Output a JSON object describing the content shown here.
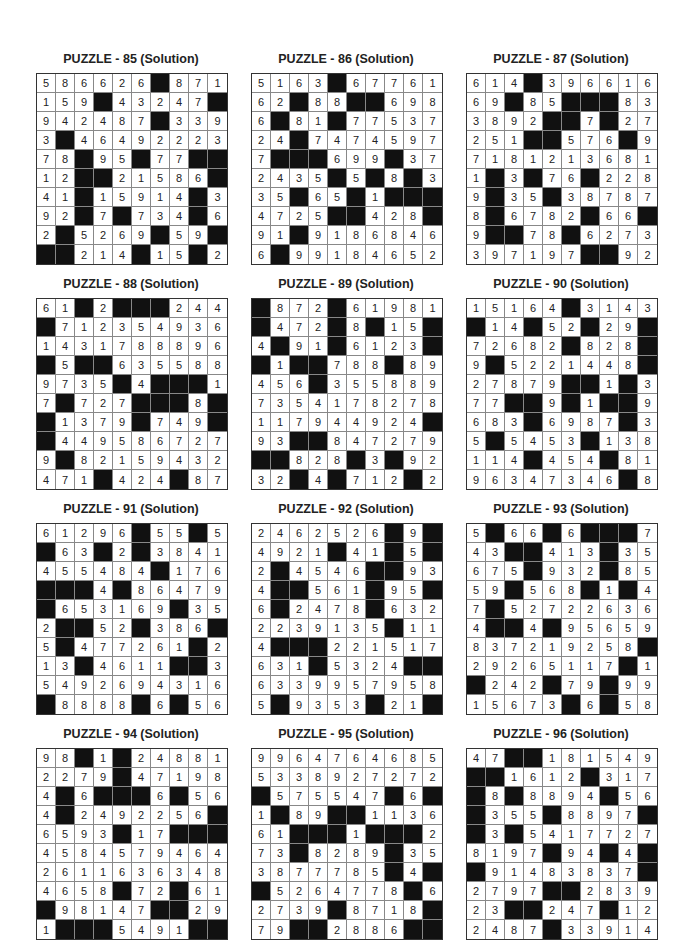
{
  "puzzles": [
    {
      "title": "PUZZLE - 85 (Solution)",
      "grid": [
        "5 8 6 6 2 6 # 8 7 1",
        "1 5 9 # 4 3 2 4 7 #",
        "9 4 2 4 8 7 # 3 3 9",
        "3 # 4 6 4 9 2 2 2 3",
        "7 8 # 9 5 # 7 7 # #",
        "1 2 # # 2 1 5 8 6 #",
        "4 1 # 1 5 9 1 4 # 3",
        "9 2 # 7 # 7 3 4 # 6",
        "2 # 5 2 6 9 # 5 9 #",
        "# # 2 1 4 # 1 5 # 2"
      ]
    },
    {
      "title": "PUZZLE - 86 (Solution)",
      "grid": [
        "5 1 6 3 # 6 7 7 6 1",
        "6 2 # 8 8 # # 6 9 8",
        "6 # 8 1 # 7 7 5 3 7",
        "2 4 # 7 4 7 4 5 9 7",
        "7 # # # 6 9 9 # 3 7",
        "2 4 3 5 # 5 # 8 # 3",
        "3 5 # 6 5 # 1 # # #",
        "4 7 2 5 # # 4 2 8 #",
        "9 1 # 9 1 8 6 8 4 6",
        "6 # 9 9 1 8 4 6 5 2"
      ]
    },
    {
      "title": "PUZZLE - 87 (Solution)",
      "grid": [
        "6 1 4 # 3 9 6 6 1 6",
        "6 9 # 8 5 # # # 8 3",
        "3 8 9 2 # # 7 # 2 7",
        "2 5 1 # # 5 7 6 # 9",
        "7 1 8 1 2 1 3 6 8 1",
        "1 # 3 # 7 6 # 2 2 8",
        "9 # 3 5 # 3 8 7 8 7",
        "8 # 6 7 8 2 # 6 6 #",
        "9 # # 7 8 # 6 2 7 3",
        "3 9 7 1 9 7 # # 9 2"
      ]
    },
    {
      "title": "PUZZLE - 88 (Solution)",
      "grid": [
        "6 1 # 2 # # # 2 4 4",
        "# 7 1 2 3 5 4 9 3 6",
        "1 4 3 1 7 8 8 8 9 6",
        "# 5 # # 6 3 5 5 8 8",
        "9 7 3 5 # 4 # # # 1",
        "7 # 7 2 7 # # # 8 #",
        "# 1 3 7 9 # 7 4 9 #",
        "# 4 4 9 5 8 6 7 2 7",
        "9 # 8 2 1 5 9 4 3 2",
        "4 7 1 # 4 2 4 # 8 7"
      ]
    },
    {
      "title": "PUZZLE - 89 (Solution)",
      "grid": [
        "# 8 7 2 # 6 1 9 8 1",
        "# 4 7 2 # 8 # 1 5 #",
        "4 # 9 1 # 6 1 2 3 #",
        "# 1 # # 7 8 8 # 8 9",
        "4 5 6 # 3 5 5 8 8 9",
        "7 3 5 4 1 7 8 2 7 8",
        "1 1 7 9 4 4 9 2 4 #",
        "9 3 # # 8 4 7 2 7 9",
        "# # 8 2 8 # 3 # 9 2",
        "3 2 # 4 # 7 1 2 # 2"
      ]
    },
    {
      "title": "PUZZLE - 90 (Solution)",
      "grid": [
        "1 5 1 6 4 # 3 1 4 3",
        "# 1 4 # 5 2 # 2 9 #",
        "7 2 6 8 2 # 8 2 8 #",
        "9 # 5 2 2 1 4 4 8 #",
        "2 7 8 7 9 # # 1 # 3",
        "7 7 # # 9 # 1 # # 9",
        "6 8 3 # 6 9 8 7 # 3",
        "5 # 5 4 5 3 # 1 3 8",
        "1 1 4 # 4 5 4 # 8 1",
        "9 6 3 4 7 3 4 6 # 8"
      ]
    },
    {
      "title": "PUZZLE - 91 (Solution)",
      "grid": [
        "6 1 2 9 6 # 5 5 # 5",
        "# 6 3 # 2 # 3 8 4 1",
        "4 5 5 4 8 4 # 1 7 6",
        "# # # 4 # 8 6 4 7 9",
        "# 6 5 3 1 6 9 # 3 5",
        "2 # # 5 2 # 3 8 6 #",
        "5 # 4 7 7 2 6 1 # 2",
        "1 3 # 4 6 1 1 # # 3",
        "5 4 9 2 6 9 4 3 1 6",
        "# 8 8 8 8 # 6 # 5 6"
      ]
    },
    {
      "title": "PUZZLE - 92 (Solution)",
      "grid": [
        "2 4 6 2 5 2 6 # 9 #",
        "4 9 2 1 # 4 1 # 5 #",
        "2 # 4 5 4 6 # # 9 3",
        "4 # # 5 6 1 # 9 5 #",
        "6 # 2 4 7 8 # 6 3 2",
        "2 2 3 9 1 3 5 # 1 1",
        "4 # # # 2 2 1 5 1 7",
        "6 3 1 # 5 3 2 4 # #",
        "6 3 3 9 9 5 7 9 5 8",
        "5 # 9 3 5 3 # 2 1 #"
      ]
    },
    {
      "title": "PUZZLE - 93 (Solution)",
      "grid": [
        "5 # 6 6 # 6 # # # 7",
        "4 3 # # 4 1 3 # 3 5",
        "6 7 5 # 9 3 2 # 8 5",
        "5 9 # 5 6 8 # 1 # 4",
        "7 # 5 2 7 2 2 6 3 6",
        "4 # # 4 # 9 5 6 5 9",
        "8 3 7 2 1 9 2 5 8 #",
        "2 9 2 6 5 1 1 7 # 1",
        "# 2 4 2 # 7 9 # 9 9",
        "1 5 6 7 3 # 6 # 5 8"
      ]
    },
    {
      "title": "PUZZLE - 94 (Solution)",
      "grid": [
        "9 8 # 1 # 2 4 8 8 1",
        "2 2 7 9 # 4 7 1 9 8",
        "4 # 6 # # # 6 # 5 6",
        "4 # 2 4 9 2 2 5 6 #",
        "6 5 9 3 # 1 7 # # #",
        "4 5 8 4 5 7 9 4 6 4",
        "2 6 1 1 6 3 6 3 4 8",
        "4 6 5 8 # 7 2 # 6 1",
        "# 9 8 1 4 7 # # 2 9",
        "1 # # # 5 4 9 1 # #"
      ]
    },
    {
      "title": "PUZZLE - 95 (Solution)",
      "grid": [
        "9 9 6 4 7 6 4 6 8 5",
        "5 3 3 8 9 2 7 2 7 2",
        "# 5 7 5 5 4 7 # 6 #",
        "1 # 8 9 # # 1 1 3 6",
        "6 1 # # # 1 # # # 2",
        "7 3 # 8 2 8 9 # 3 5",
        "3 8 7 7 7 8 5 # 4 #",
        "# 5 2 6 4 7 7 8 # 6",
        "2 7 3 9 # 8 7 1 8 #",
        "7 9 # # 2 8 8 6 # #"
      ]
    },
    {
      "title": "PUZZLE - 96 (Solution)",
      "grid": [
        "4 7 # # 1 8 1 5 4 9",
        "# # 1 6 1 2 # 3 1 7",
        "# 8 # 8 8 9 4 # 5 6",
        "# 3 5 5 # 8 8 9 7 #",
        "# 3 # 5 4 1 7 7 2 7",
        "8 1 9 7 # 9 4 # 4 #",
        "# 9 1 4 8 3 8 3 7 #",
        "2 7 9 7 # # 2 8 3 9",
        "2 3 # # 2 4 7 # 1 2",
        "2 4 8 7 # 3 3 9 1 4"
      ]
    }
  ]
}
